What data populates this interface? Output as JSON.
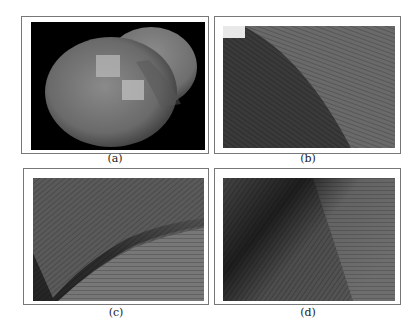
{
  "figure": {
    "panels": [
      {
        "id": "a",
        "caption": "(a)",
        "description": "rendered heart-shaped 3D surface on black background with two highlighted square patches"
      },
      {
        "id": "b",
        "caption": "(b)",
        "description": "zoomed texture field: dark lower-left region separated by curved boundary from lighter hatched region"
      },
      {
        "id": "c",
        "caption": "(c)",
        "description": "zoomed texture field: diagonal dark ridge from lower-left to upper-right with hatched flow lines"
      },
      {
        "id": "d",
        "caption": "(d)",
        "description": "zoomed texture field: dark diagonal band from upper-left to bottom with vector flow lines curving at right"
      }
    ]
  }
}
